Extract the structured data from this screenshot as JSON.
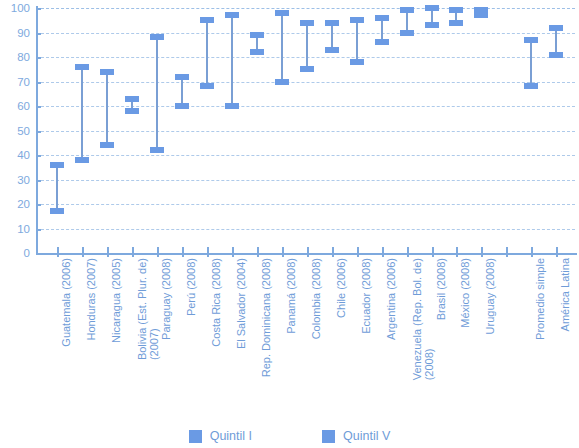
{
  "chart_data": {
    "type": "bar",
    "subtype": "range-bar",
    "title": "",
    "xlabel": "",
    "ylabel": "",
    "ylim": [
      0,
      100
    ],
    "yticks": [
      0,
      10,
      20,
      30,
      40,
      50,
      60,
      70,
      80,
      90,
      100
    ],
    "grid": true,
    "legend_position": "bottom",
    "categories": [
      "Guatemala (2006)",
      "Honduras (2007)",
      "Nicaragua (2005)",
      "Bolivia (Est. Plur. de) (2007)",
      "Paraguay (2008)",
      "Perú (2008)",
      "Costa Rica (2008)",
      "El Salvador (2004)",
      "Rep. Dominicana (2008)",
      "Panamá (2008)",
      "Colombia (2008)",
      "Chile (2006)",
      "Ecuador (2008)",
      "Argentina (2006)",
      "Venezuela (Rep. Bol. de) (2008)",
      "Brasil (2008)",
      "México (2008)",
      "Uruguay (2008)",
      "",
      "Promedio simple",
      "América Latina"
    ],
    "series": [
      {
        "name": "Quintil I",
        "color": "#6a9ae4",
        "values": [
          17,
          38,
          44,
          58,
          42,
          60,
          68,
          60,
          82,
          70,
          75,
          83,
          78,
          86,
          90,
          93,
          94,
          97,
          null,
          68,
          81
        ]
      },
      {
        "name": "Quintil V",
        "color": "#6a9ae4",
        "values": [
          36,
          76,
          74,
          63,
          88,
          72,
          95,
          97,
          89,
          98,
          94,
          94,
          95,
          96,
          99,
          100,
          99,
          99,
          null,
          87,
          92
        ]
      }
    ]
  },
  "axis": {
    "y_tick_labels": [
      "100",
      "90",
      "80",
      "70",
      "60",
      "50",
      "40",
      "30",
      "20",
      "10",
      "0"
    ]
  },
  "category_labels": [
    {
      "line1": "Guatemala (2006)",
      "line2": ""
    },
    {
      "line1": "Honduras (2007)",
      "line2": ""
    },
    {
      "line1": "Nicaragua (2005)",
      "line2": ""
    },
    {
      "line1": "Bolivia (Est. Plur. de)",
      "line2": "(2007)"
    },
    {
      "line1": "Paraguay (2008)",
      "line2": ""
    },
    {
      "line1": "Perú (2008)",
      "line2": ""
    },
    {
      "line1": "Costa Rica (2008)",
      "line2": ""
    },
    {
      "line1": "El Salvador (2004)",
      "line2": ""
    },
    {
      "line1": "Rep. Dominicana (2008)",
      "line2": ""
    },
    {
      "line1": "Panamá (2008)",
      "line2": ""
    },
    {
      "line1": "Colombia (2008)",
      "line2": ""
    },
    {
      "line1": "Chile (2006)",
      "line2": ""
    },
    {
      "line1": "Ecuador (2008)",
      "line2": ""
    },
    {
      "line1": "Argentina (2006)",
      "line2": ""
    },
    {
      "line1": "Venezuela (Rep. Bol. de)",
      "line2": "(2008)"
    },
    {
      "line1": "Brasil (2008)",
      "line2": ""
    },
    {
      "line1": "México (2008)",
      "line2": ""
    },
    {
      "line1": "Uruguay (2008)",
      "line2": ""
    },
    {
      "line1": "",
      "line2": ""
    },
    {
      "line1": "Promedio simple",
      "line2": ""
    },
    {
      "line1": "América Latina",
      "line2": ""
    }
  ],
  "legend": {
    "items": [
      {
        "label": "Quintil I",
        "color": "#6a9ae4"
      },
      {
        "label": "Quintil V",
        "color": "#6a9ae4"
      }
    ]
  },
  "colors": {
    "marker": "#6a9ae4",
    "stem": "#7a9fd4",
    "axis": "#7ea9de",
    "grid": "#aecaea",
    "text": "#6f9cd8",
    "background": "#ffffff"
  }
}
